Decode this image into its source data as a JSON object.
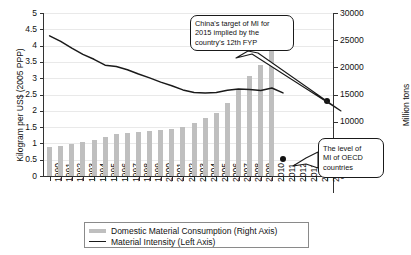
{
  "chart_data": {
    "type": "bar",
    "title": "",
    "xlabel": "",
    "ylabel": "Kilogram per US$ (2005 PPP)",
    "y2label": "Million tons",
    "categories": [
      "1990",
      "1991",
      "1992",
      "1993",
      "1994",
      "1995",
      "1996",
      "1997",
      "1998",
      "1999",
      "2000",
      "2001",
      "2002",
      "2003",
      "2004",
      "2005",
      "2006",
      "2007",
      "2008",
      "2009",
      "2010",
      "2011",
      "2012",
      "2013",
      "2014",
      "2015"
    ],
    "ylim": [
      0,
      5
    ],
    "yticks": [
      "0",
      "0.5",
      "1",
      "1.5",
      "2",
      "2.5",
      "3",
      "3.5",
      "4",
      "4.5",
      "5"
    ],
    "y2lim": [
      0,
      30000
    ],
    "y2ticks": [
      "0",
      "5000",
      "10000",
      "15000",
      "20000",
      "25000",
      "30000"
    ],
    "grid": true,
    "legend_position": "bottom",
    "series": [
      {
        "name": "Domestic Material Consumption (Right Axis)",
        "axis": "right",
        "type": "bar",
        "color": "#bfbfbf",
        "values": [
          5300,
          5500,
          5950,
          6250,
          6700,
          7200,
          7700,
          7850,
          8150,
          8300,
          8550,
          8600,
          9100,
          9800,
          10700,
          11600,
          13450,
          15900,
          18350,
          20500,
          26400,
          null,
          null,
          null,
          null,
          null
        ]
      },
      {
        "name": "Material Intensity (Left Axis)",
        "axis": "left",
        "type": "line",
        "color": "#1a1a1a",
        "values": [
          4.3,
          4.13,
          3.92,
          3.73,
          3.58,
          3.4,
          3.36,
          3.26,
          3.13,
          3.01,
          2.88,
          2.77,
          2.64,
          2.56,
          2.55,
          2.56,
          2.63,
          2.67,
          2.65,
          2.62,
          2.7,
          2.55,
          null,
          null,
          null,
          null
        ]
      }
    ],
    "markers": [
      {
        "name": "china-2015-target",
        "x": "2015",
        "value": 2.3,
        "axis": "left",
        "color": "#111111"
      },
      {
        "name": "oecd-level",
        "x": "2011",
        "value": 0.52,
        "axis": "left",
        "color": "#111111"
      }
    ],
    "annotations": [
      {
        "name": "china-target-callout",
        "text": "China's target of MI for 2015 implied by the country's 12th FYP",
        "points_to": "china-2015-target"
      },
      {
        "name": "oecd-level-callout",
        "text": "The level of MI of OECD countries",
        "points_to": "oecd-level"
      }
    ]
  },
  "legend": {
    "items": [
      {
        "label": "Domestic Material Consumption (Right Axis)",
        "marker": "bar-swatch"
      },
      {
        "label": "Material Intensity (Left Axis)",
        "marker": "line-swatch"
      }
    ]
  },
  "callouts": {
    "target": {
      "line1": "China's target of MI for",
      "line2": "2015 implied by the",
      "line3": "country's 12th FYP"
    },
    "oecd": {
      "line1": "The level of",
      "line2": "MI of OECD",
      "line3": "countries"
    }
  }
}
